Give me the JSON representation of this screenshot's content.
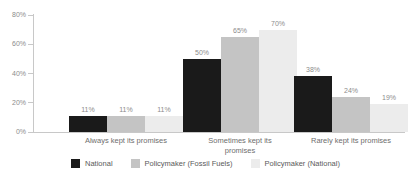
{
  "chart_data": {
    "type": "bar",
    "title": "",
    "subtitle": "",
    "xlabel": "",
    "ylabel": "",
    "ylim": [
      0,
      80
    ],
    "ytick_labels": [
      "0%",
      "20%",
      "40%",
      "60%",
      "80%"
    ],
    "ytick_values": [
      0,
      20,
      40,
      60,
      80
    ],
    "grid": false,
    "legend_position": "bottom",
    "value_suffix": "%",
    "categories": [
      "Always kept its promises",
      "Sometimes kept its\npromises",
      "Rarely kept its promises"
    ],
    "series": [
      {
        "name": "National",
        "color": "#1a1a1a",
        "values": [
          11,
          50,
          38
        ],
        "labels": [
          "11%",
          "50%",
          "38%"
        ]
      },
      {
        "name": "Policymaker (Fossil Fuels)",
        "color": "#c4c4c4",
        "values": [
          11,
          65,
          24
        ],
        "labels": [
          "11%",
          "65%",
          "24%"
        ]
      },
      {
        "name": "Policymaker (National)",
        "color": "#ececec",
        "values": [
          11,
          70,
          19
        ],
        "labels": [
          "11%",
          "70%",
          "19%"
        ]
      }
    ]
  },
  "colors": {
    "background": "#ffffff",
    "axis": "#c8c8c8",
    "tick_text": "#8c8c8c",
    "category_text": "#6e6e6e",
    "legend_text": "#5a5a5a",
    "series_national": "#1a1a1a",
    "series_policymaker_fossil_fuels": "#c4c4c4",
    "series_policymaker_national": "#ececec"
  }
}
